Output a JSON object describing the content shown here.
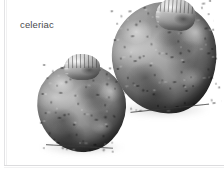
{
  "figure": {
    "caption": "celeriac",
    "caption_color": "#4a4a4c",
    "background_color": "#ffffff",
    "border_color": "#e3e3e5",
    "rendering": "grayscale-photograph",
    "subjects": [
      {
        "name": "celeriac-root-large",
        "position": "upper-right",
        "description": "large knobby celeriac root with cut stem crown on top"
      },
      {
        "name": "celeriac-root-small",
        "position": "lower-left",
        "description": "smaller knobby celeriac root with cut stem crown on top"
      }
    ]
  },
  "icons": {
    "celeriac_bulb": "root-vegetable-icon",
    "celeriac_crown": "cut-stem-icon",
    "celeriac_roots": "root-fibres-icon"
  }
}
